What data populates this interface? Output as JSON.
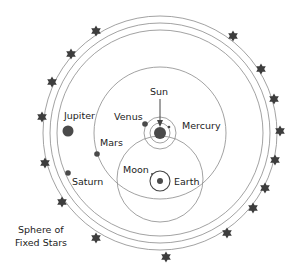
{
  "diagram": {
    "colors": {
      "background": "#ffffff",
      "orbit_line": "#8a8a8a",
      "planet_fill": "#4a4a4a",
      "star_fill": "#3d3d3d",
      "text": "#222222"
    },
    "labels": {
      "sun": "Sun",
      "mercury": "Mercury",
      "venus": "Venus",
      "mars": "Mars",
      "jupiter": "Jupiter",
      "saturn": "Saturn",
      "moon": "Moon",
      "earth": "Earth",
      "fixed_stars_line1": "Sphere of",
      "fixed_stars_line2": "Fixed Stars"
    },
    "bodies": [
      {
        "name": "Sun",
        "x": 160,
        "y": 133,
        "r": 6
      },
      {
        "name": "Earth",
        "x": 160,
        "y": 181,
        "r": 3
      },
      {
        "name": "Moon",
        "x": 152,
        "y": 174,
        "r": 1
      },
      {
        "name": "Mercury",
        "x": 169,
        "y": 127,
        "r": 1.3
      },
      {
        "name": "Venus",
        "x": 145,
        "y": 124,
        "r": 2.8
      },
      {
        "name": "Mars",
        "x": 97,
        "y": 154,
        "r": 2.8
      },
      {
        "name": "Jupiter",
        "x": 68,
        "y": 131,
        "r": 5.5
      },
      {
        "name": "Saturn",
        "x": 68,
        "y": 173,
        "r": 2.8
      }
    ],
    "orbits": [
      {
        "name": "outer-sphere-1",
        "cx": 160,
        "cy": 133,
        "r": 117
      },
      {
        "name": "outer-sphere-2",
        "cx": 160,
        "cy": 133,
        "r": 110
      },
      {
        "name": "outer-sphere-3",
        "cx": 160,
        "cy": 133,
        "r": 103
      },
      {
        "name": "mars-orbit",
        "cx": 160,
        "cy": 133,
        "r": 66
      },
      {
        "name": "venus-orbit",
        "cx": 160,
        "cy": 133,
        "r": 16
      },
      {
        "name": "mercury-orbit",
        "cx": 160,
        "cy": 133,
        "r": 10
      },
      {
        "name": "sun-orbit",
        "cx": 160,
        "cy": 179,
        "r": 43
      },
      {
        "name": "moon-orbit",
        "cx": 160,
        "cy": 181,
        "r": 10
      }
    ],
    "stars": [
      [
        96,
        31
      ],
      [
        71,
        54
      ],
      [
        52,
        82
      ],
      [
        42,
        117
      ],
      [
        45,
        163
      ],
      [
        62,
        202
      ],
      [
        96,
        238
      ],
      [
        166,
        257
      ],
      [
        227,
        233
      ],
      [
        253,
        208
      ],
      [
        265,
        188
      ],
      [
        275,
        160
      ],
      [
        280,
        131
      ],
      [
        274,
        99
      ],
      [
        261,
        69
      ],
      [
        233,
        36
      ]
    ]
  }
}
